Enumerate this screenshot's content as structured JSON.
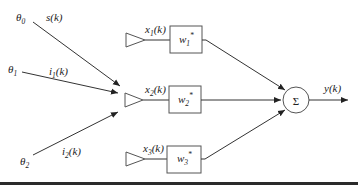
{
  "diagram": {
    "type": "adaptive beamformer / linear combiner block diagram",
    "sources": [
      {
        "angle_symbol": "θ",
        "angle_index": "0",
        "signal": "s",
        "signal_index": "",
        "signal_arg": "(k)"
      },
      {
        "angle_symbol": "θ",
        "angle_index": "1",
        "signal": "i",
        "signal_index": "1",
        "signal_arg": "(k)"
      },
      {
        "angle_symbol": "θ",
        "angle_index": "2",
        "signal": "i",
        "signal_index": "2",
        "signal_arg": "(k)"
      }
    ],
    "sensors": [
      {
        "input": "x",
        "index": "1",
        "arg": "(k)",
        "weight": "w",
        "weight_index": "1",
        "conj": "*"
      },
      {
        "input": "x",
        "index": "2",
        "arg": "(k)",
        "weight": "w",
        "weight_index": "2",
        "conj": "*"
      },
      {
        "input": "x",
        "index": "3",
        "arg": "(k)",
        "weight": "w",
        "weight_index": "3",
        "conj": "*"
      }
    ],
    "summer": {
      "symbol": "Σ"
    },
    "output": {
      "label": "y(k)"
    }
  },
  "colors": {
    "line": "#333333",
    "box_border": "#555555",
    "text": "#222222",
    "bottom_rule": "#2a2a2a",
    "background": "#ffffff"
  }
}
